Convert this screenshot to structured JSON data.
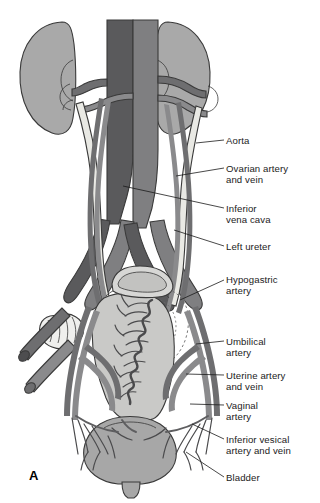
{
  "figure": {
    "panel_letter": "A",
    "background_color": "#ffffff",
    "palette": {
      "kidney": "#a9a9a9",
      "bladder": "#a7a7a7",
      "inferior_vena_cava": "#5a5a5c",
      "aorta": "#7f7f81",
      "vessel_dark": "#6e6e70",
      "vessel_mid": "#8a8a8c",
      "ureter": "#e9e9e4",
      "uterus": "#c9c9c7",
      "ovary": "#efefed",
      "outline": "#3a3a3a",
      "leader_line": "#1b1b1b",
      "label_text": "#1b1b1b"
    }
  },
  "labels": [
    {
      "id": "aorta",
      "text": "Aorta",
      "x": 226,
      "y": 135,
      "leader": {
        "x1": 196,
        "y1": 143,
        "x2": 224,
        "y2": 140
      }
    },
    {
      "id": "ovarian-vessels",
      "text": "Ovarian artery\nand vein",
      "x": 226,
      "y": 163,
      "leader": {
        "x1": 176,
        "y1": 176,
        "x2": 224,
        "y2": 168
      }
    },
    {
      "id": "inferior-vena-cava",
      "text": "Inferior\nvena cava",
      "x": 226,
      "y": 203,
      "leader": {
        "x1": 123,
        "y1": 186,
        "x2": 224,
        "y2": 208
      }
    },
    {
      "id": "left-ureter",
      "text": "Left ureter",
      "x": 226,
      "y": 241,
      "leader": {
        "x1": 174,
        "y1": 230,
        "x2": 224,
        "y2": 246
      }
    },
    {
      "id": "hypogastric-artery",
      "text": "Hypogastric\nartery",
      "x": 226,
      "y": 274,
      "leader": {
        "x1": 180,
        "y1": 300,
        "x2": 224,
        "y2": 280
      }
    },
    {
      "id": "umbilical-artery",
      "text": "Umbilical\nartery",
      "x": 226,
      "y": 336,
      "leader": {
        "x1": 196,
        "y1": 344,
        "x2": 224,
        "y2": 341
      }
    },
    {
      "id": "uterine-vessels",
      "text": "Uterine artery\nand vein",
      "x": 226,
      "y": 370,
      "leader": {
        "x1": 186,
        "y1": 374,
        "x2": 224,
        "y2": 375
      }
    },
    {
      "id": "vaginal-artery",
      "text": "Vaginal\nartery",
      "x": 226,
      "y": 400,
      "leader": {
        "x1": 190,
        "y1": 404,
        "x2": 224,
        "y2": 405
      }
    },
    {
      "id": "inferior-vesical",
      "text": "Inferior vesical\nartery and vein",
      "x": 226,
      "y": 434,
      "leader": {
        "x1": 192,
        "y1": 424,
        "x2": 224,
        "y2": 439
      }
    },
    {
      "id": "bladder",
      "text": "Bladder",
      "x": 226,
      "y": 472,
      "leader": {
        "x1": 186,
        "y1": 452,
        "x2": 224,
        "y2": 477
      }
    }
  ],
  "structures": [
    {
      "id": "left-kidney",
      "name": "Left kidney"
    },
    {
      "id": "right-kidney",
      "name": "Right kidney"
    },
    {
      "id": "aorta",
      "name": "Aorta"
    },
    {
      "id": "ivc",
      "name": "Inferior vena cava"
    },
    {
      "id": "renal-vessels",
      "name": "Renal arteries and veins"
    },
    {
      "id": "ureters",
      "name": "Ureters"
    },
    {
      "id": "ovarian-vessels",
      "name": "Ovarian arteries and veins"
    },
    {
      "id": "common-iliac",
      "name": "Common iliac vessels"
    },
    {
      "id": "hypogastric",
      "name": "Hypogastric (internal iliac) artery"
    },
    {
      "id": "uterus",
      "name": "Uterus"
    },
    {
      "id": "fallopian-tube",
      "name": "Fallopian tube"
    },
    {
      "id": "ovary",
      "name": "Ovary"
    },
    {
      "id": "broad-ligament",
      "name": "Broad ligament"
    },
    {
      "id": "uterine-vessels",
      "name": "Uterine artery and vein"
    },
    {
      "id": "bladder",
      "name": "Bladder"
    },
    {
      "id": "urethra",
      "name": "Urethra"
    }
  ]
}
